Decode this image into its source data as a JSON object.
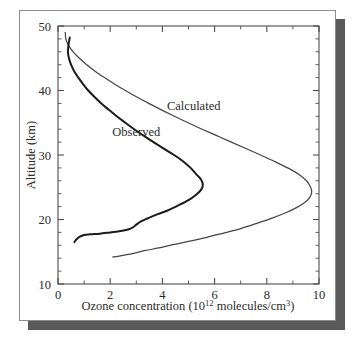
{
  "figure": {
    "frame": {
      "border_color": "#8c8c8c",
      "background_color": "#ffffff",
      "shadow_color": "#5a5a5a"
    }
  },
  "chart_data": {
    "type": "line",
    "title": "",
    "xlabel_parts": {
      "prefix": "Ozone concentration (10",
      "exponent": "12",
      "suffix": " molecules/cm",
      "suffix_exponent": "3",
      "tail": ")"
    },
    "xlabel": "Ozone concentration (10^12 molecules/cm^3)",
    "ylabel": "Altitude (km)",
    "xlim": [
      0,
      10
    ],
    "ylim": [
      10,
      50
    ],
    "xticks": [
      0,
      2,
      4,
      6,
      8,
      10
    ],
    "xticklabels": [
      "0",
      "2",
      "4",
      "6",
      "8",
      "10"
    ],
    "x_minor_step": 1,
    "yticks": [
      10,
      20,
      30,
      40,
      50
    ],
    "yticklabels": [
      "10",
      "20",
      "30",
      "40",
      "50"
    ],
    "y_minor_step": 2,
    "grid": false,
    "legend_position": "inline-annotations",
    "orientation": "x-is-concentration, y-is-altitude",
    "annotations": [
      {
        "text": "Calculated",
        "x": 5.2,
        "y": 37.0
      },
      {
        "text": "Observed",
        "x": 3.0,
        "y": 33.0
      }
    ],
    "series": [
      {
        "name": "Observed",
        "color": "#1b1b1b",
        "line_width": 2.0,
        "points": [
          {
            "x": 0.45,
            "y": 48.2
          },
          {
            "x": 0.4,
            "y": 47.0
          },
          {
            "x": 0.38,
            "y": 46.0
          },
          {
            "x": 0.42,
            "y": 45.0
          },
          {
            "x": 0.5,
            "y": 44.0
          },
          {
            "x": 0.62,
            "y": 43.0
          },
          {
            "x": 0.78,
            "y": 42.0
          },
          {
            "x": 0.96,
            "y": 41.0
          },
          {
            "x": 1.16,
            "y": 40.0
          },
          {
            "x": 1.4,
            "y": 39.0
          },
          {
            "x": 1.66,
            "y": 38.0
          },
          {
            "x": 1.95,
            "y": 37.0
          },
          {
            "x": 2.25,
            "y": 36.0
          },
          {
            "x": 2.58,
            "y": 35.0
          },
          {
            "x": 2.92,
            "y": 34.0
          },
          {
            "x": 3.28,
            "y": 33.0
          },
          {
            "x": 3.66,
            "y": 32.0
          },
          {
            "x": 4.05,
            "y": 31.0
          },
          {
            "x": 4.45,
            "y": 30.0
          },
          {
            "x": 4.8,
            "y": 29.0
          },
          {
            "x": 5.08,
            "y": 28.0
          },
          {
            "x": 5.3,
            "y": 27.0
          },
          {
            "x": 5.48,
            "y": 26.2
          },
          {
            "x": 5.55,
            "y": 25.4
          },
          {
            "x": 5.48,
            "y": 24.6
          },
          {
            "x": 5.28,
            "y": 23.8
          },
          {
            "x": 5.0,
            "y": 23.0
          },
          {
            "x": 4.62,
            "y": 22.2
          },
          {
            "x": 4.2,
            "y": 21.4
          },
          {
            "x": 3.8,
            "y": 20.8
          },
          {
            "x": 3.45,
            "y": 20.2
          },
          {
            "x": 3.18,
            "y": 19.7
          },
          {
            "x": 3.0,
            "y": 19.2
          },
          {
            "x": 2.88,
            "y": 18.8
          },
          {
            "x": 2.72,
            "y": 18.5
          },
          {
            "x": 2.4,
            "y": 18.2
          },
          {
            "x": 2.0,
            "y": 18.0
          },
          {
            "x": 1.6,
            "y": 17.8
          },
          {
            "x": 1.25,
            "y": 17.7
          },
          {
            "x": 1.0,
            "y": 17.6
          },
          {
            "x": 0.82,
            "y": 17.3
          },
          {
            "x": 0.7,
            "y": 16.9
          },
          {
            "x": 0.63,
            "y": 16.5
          }
        ]
      },
      {
        "name": "Calculated",
        "color": "#45454a",
        "line_width": 1.25,
        "points": [
          {
            "x": 0.28,
            "y": 49.0
          },
          {
            "x": 0.3,
            "y": 48.0
          },
          {
            "x": 0.4,
            "y": 47.0
          },
          {
            "x": 0.58,
            "y": 46.0
          },
          {
            "x": 0.82,
            "y": 45.0
          },
          {
            "x": 1.1,
            "y": 44.0
          },
          {
            "x": 1.42,
            "y": 43.0
          },
          {
            "x": 1.78,
            "y": 42.0
          },
          {
            "x": 2.16,
            "y": 41.0
          },
          {
            "x": 2.58,
            "y": 40.0
          },
          {
            "x": 3.02,
            "y": 39.0
          },
          {
            "x": 3.48,
            "y": 38.0
          },
          {
            "x": 3.96,
            "y": 37.0
          },
          {
            "x": 4.46,
            "y": 36.0
          },
          {
            "x": 4.98,
            "y": 35.0
          },
          {
            "x": 5.52,
            "y": 34.0
          },
          {
            "x": 6.08,
            "y": 33.0
          },
          {
            "x": 6.64,
            "y": 32.0
          },
          {
            "x": 7.2,
            "y": 31.0
          },
          {
            "x": 7.76,
            "y": 30.0
          },
          {
            "x": 8.3,
            "y": 29.0
          },
          {
            "x": 8.8,
            "y": 28.0
          },
          {
            "x": 9.22,
            "y": 27.0
          },
          {
            "x": 9.52,
            "y": 26.0
          },
          {
            "x": 9.68,
            "y": 25.0
          },
          {
            "x": 9.72,
            "y": 24.2
          },
          {
            "x": 9.64,
            "y": 23.4
          },
          {
            "x": 9.44,
            "y": 22.6
          },
          {
            "x": 9.12,
            "y": 21.8
          },
          {
            "x": 8.7,
            "y": 21.0
          },
          {
            "x": 8.2,
            "y": 20.2
          },
          {
            "x": 7.62,
            "y": 19.4
          },
          {
            "x": 7.0,
            "y": 18.6
          },
          {
            "x": 6.34,
            "y": 17.9
          },
          {
            "x": 5.66,
            "y": 17.2
          },
          {
            "x": 5.0,
            "y": 16.6
          },
          {
            "x": 4.4,
            "y": 16.1
          },
          {
            "x": 3.86,
            "y": 15.6
          },
          {
            "x": 3.36,
            "y": 15.2
          },
          {
            "x": 2.94,
            "y": 14.8
          },
          {
            "x": 2.58,
            "y": 14.5
          },
          {
            "x": 2.3,
            "y": 14.3
          },
          {
            "x": 2.1,
            "y": 14.2
          }
        ]
      }
    ]
  }
}
